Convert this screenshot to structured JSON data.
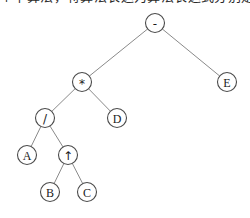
{
  "header": {
    "text": "个中算法，将算法表达为算法表达式分别定"
  },
  "diagram": {
    "expression": "A / B ↑ C * D - E",
    "background_color": "#ffffff",
    "edge_color": "#8a8a8a",
    "node_stroke_color": "#4a4a4a",
    "node_fill_color": "#ffffff",
    "node_radius": 9.5,
    "nodes": [
      {
        "id": "n0",
        "label": "-",
        "kind": "operator",
        "x": 155,
        "y": 23,
        "level": 0
      },
      {
        "id": "n1",
        "label": "*",
        "kind": "operator",
        "x": 82,
        "y": 82,
        "level": 1
      },
      {
        "id": "n2",
        "label": "E",
        "kind": "operand",
        "x": 227,
        "y": 82,
        "level": 1
      },
      {
        "id": "n3",
        "label": "/",
        "kind": "operator",
        "x": 45,
        "y": 118,
        "level": 2
      },
      {
        "id": "n4",
        "label": "D",
        "kind": "operand",
        "x": 117,
        "y": 118,
        "level": 2
      },
      {
        "id": "n5",
        "label": "A",
        "kind": "operand",
        "x": 27,
        "y": 155,
        "level": 3
      },
      {
        "id": "n6",
        "label": "↑",
        "kind": "operator",
        "x": 68,
        "y": 155,
        "level": 3
      },
      {
        "id": "n7",
        "label": "B",
        "kind": "operand",
        "x": 50,
        "y": 192,
        "level": 4
      },
      {
        "id": "n8",
        "label": "C",
        "kind": "operand",
        "x": 87,
        "y": 192,
        "level": 4
      }
    ],
    "edges": [
      {
        "from": "n0",
        "to": "n1"
      },
      {
        "from": "n0",
        "to": "n2"
      },
      {
        "from": "n1",
        "to": "n3"
      },
      {
        "from": "n1",
        "to": "n4"
      },
      {
        "from": "n3",
        "to": "n5"
      },
      {
        "from": "n3",
        "to": "n6"
      },
      {
        "from": "n6",
        "to": "n7"
      },
      {
        "from": "n6",
        "to": "n8"
      }
    ]
  }
}
